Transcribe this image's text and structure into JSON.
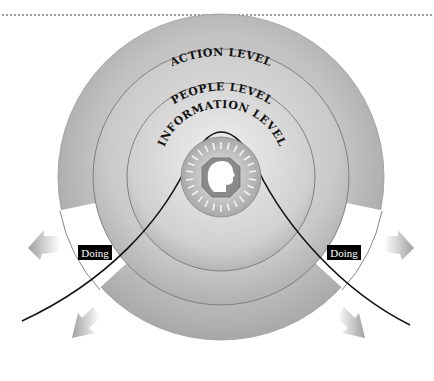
{
  "diagram": {
    "rings": [
      {
        "id": "action",
        "label": "ACTION LEVEL"
      },
      {
        "id": "people",
        "label": "PEOPLE LEVEL"
      },
      {
        "id": "information",
        "label": "INFORMATION LEVEL"
      }
    ],
    "side_labels": {
      "left": "Doing",
      "right": "Doing"
    },
    "center": {
      "icon": "head-profile-icon"
    },
    "arrows": [
      "arrow-upper-left",
      "arrow-lower-left",
      "arrow-upper-right",
      "arrow-lower-right"
    ],
    "colors": {
      "ring_outer": "#b8b8b8",
      "ring_mid": "#c4c4c4",
      "ring_inner": "#cfcfcf",
      "label_bg": "#000000",
      "curve": "#111111",
      "dotted_rule": "#9a9a9a"
    }
  }
}
